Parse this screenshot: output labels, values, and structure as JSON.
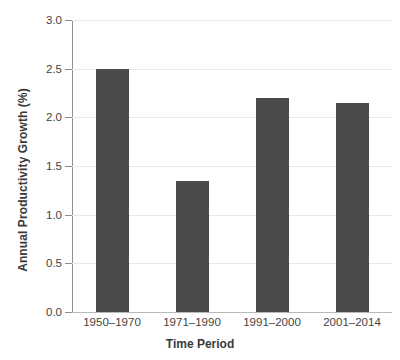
{
  "chart_data": {
    "type": "bar",
    "title": "",
    "xlabel": "Time Period",
    "ylabel": "Annual Productivity Growth (%)",
    "categories": [
      "1950–1970",
      "1971–1990",
      "1991–2000",
      "2001–2014"
    ],
    "values": [
      2.5,
      1.35,
      2.2,
      2.15
    ],
    "ylim": [
      0.0,
      3.0
    ],
    "ytick_labels": [
      "0.0",
      "0.5",
      "1.0",
      "1.5",
      "2.0",
      "2.5",
      "3.0"
    ],
    "ytick_values": [
      0.0,
      0.5,
      1.0,
      1.5,
      2.0,
      2.5,
      3.0
    ],
    "grid": "horizontal",
    "legend": "none",
    "bar_color": "#4a4a4a",
    "grid_color": "#e9e9e9",
    "axis_color": "#8e8e8e",
    "background_color": "#ffffff"
  }
}
